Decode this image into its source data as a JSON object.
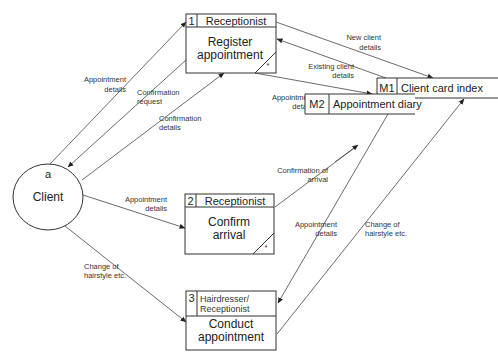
{
  "diagram": {
    "type": "data-flow-diagram",
    "external_entities": [
      {
        "id": "a",
        "label": "Client"
      }
    ],
    "processes": [
      {
        "number": "1",
        "actor": "Receptionist",
        "name_line1": "Register",
        "name_line2": "appointment",
        "duplicate_marker": "*"
      },
      {
        "number": "2",
        "actor": "Receptionist",
        "name_line1": "Confirm",
        "name_line2": "arrival",
        "duplicate_marker": "*"
      },
      {
        "number": "3",
        "actor_line1": "Hairdresser/",
        "actor_line2": "Receptionist",
        "name_line1": "Conduct",
        "name_line2": "appointment"
      }
    ],
    "data_stores": [
      {
        "id": "M1",
        "label": "Client card index"
      },
      {
        "id": "M2",
        "label": "Appointment diary"
      }
    ],
    "flows": [
      {
        "from": "a",
        "to": "1",
        "line1": "Appointment",
        "line2": "details"
      },
      {
        "from": "1",
        "to": "a",
        "line1": "Confirmation",
        "line2": "request"
      },
      {
        "from": "a",
        "to": "1",
        "line1": "Confirmation",
        "line2": "details"
      },
      {
        "from": "1",
        "to": "M1",
        "line1": "New client",
        "line2": "details"
      },
      {
        "from": "M1",
        "to": "1",
        "line1": "Existing client",
        "line2": "details"
      },
      {
        "from": "1",
        "to": "M2",
        "line1": "Appointment",
        "line2": "details"
      },
      {
        "from": "2",
        "to": "M2",
        "line1": "Confirmation of",
        "line2": "arrival"
      },
      {
        "from": "a",
        "to": "2",
        "line1": "Appointment",
        "line2": "details"
      },
      {
        "from": "M2",
        "to": "3",
        "line1": "Appointment",
        "line2": "details"
      },
      {
        "from": "3",
        "to": "M1",
        "line1": "Change of",
        "line2": "hairstyle etc."
      },
      {
        "from": "a",
        "to": "3",
        "line1": "Change of",
        "line2": "hairstyle etc."
      }
    ]
  }
}
